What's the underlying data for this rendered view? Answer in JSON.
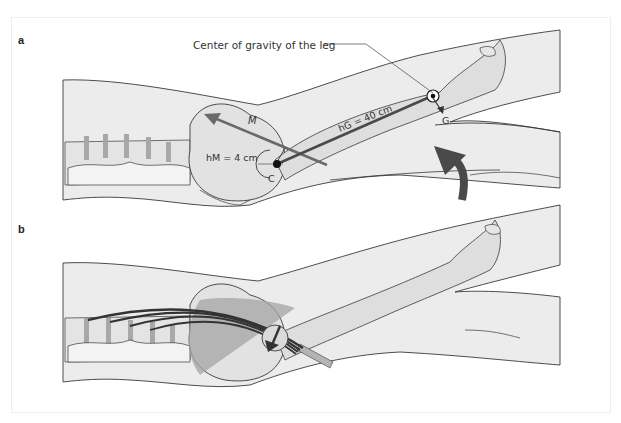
{
  "figure": {
    "panels": [
      {
        "id": "a",
        "label": "a",
        "annotations": {
          "center_of_gravity": "Center of gravity of the leg",
          "muscle_force": "M",
          "muscle_lever_arm": "hM = 4 cm",
          "gravity_lever_arm": "hG = 40 cm",
          "rotation_center": "C",
          "gravity_force": "G"
        }
      },
      {
        "id": "b",
        "label": "b"
      }
    ],
    "colors": {
      "skin_fill": "#ececec",
      "bone_fill": "#dcdcdc",
      "outline": "#3a3a3a",
      "arrow_dark": "#4a4a4a",
      "muscle": "#9a9a9a"
    }
  }
}
